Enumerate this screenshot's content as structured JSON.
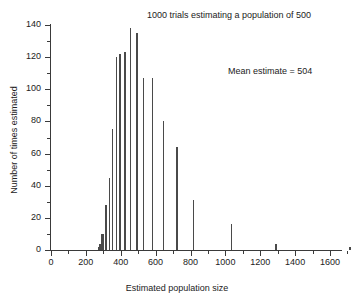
{
  "chart_data": {
    "type": "bar",
    "title": "1000 trials estimating a population of 500",
    "xlabel": "Estimated population size",
    "ylabel": "Number of times estimated",
    "annotation": "Mean estimate = 504",
    "xlim": [
      0,
      1750
    ],
    "ylim": [
      0,
      140
    ],
    "x_ticks": [
      0,
      200,
      400,
      600,
      800,
      1000,
      1200,
      1400,
      1600
    ],
    "x_minor_step": 100,
    "y_ticks": [
      0,
      20,
      40,
      60,
      80,
      100,
      120,
      140
    ],
    "y_minor_step": 10,
    "grid": false,
    "legend": false,
    "bar_color": "#4a4a4a",
    "x": [
      270,
      281,
      292,
      303,
      315,
      327,
      341,
      355,
      371,
      388,
      406,
      426,
      447,
      471,
      497,
      526,
      558,
      594,
      635,
      681,
      735,
      798,
      857,
      1030,
      1285,
      1710
    ],
    "values": [
      2,
      3,
      10,
      10,
      5,
      28,
      45,
      75,
      28,
      120,
      122,
      123,
      138,
      135,
      107,
      107,
      80,
      80,
      64,
      31,
      31,
      16,
      4,
      16,
      4,
      2
    ],
    "categories": [
      "270",
      "281",
      "292",
      "303",
      "315",
      "327",
      "341",
      "355",
      "371",
      "388",
      "406",
      "426",
      "447",
      "471",
      "497",
      "526",
      "558",
      "594",
      "635",
      "681",
      "735",
      "798",
      "857",
      "1030",
      "1285",
      "1710"
    ],
    "series": [
      {
        "name": "Estimate frequency",
        "points": [
          {
            "x": 268,
            "y": 2
          },
          {
            "x": 278,
            "y": 4
          },
          {
            "x": 288,
            "y": 10
          },
          {
            "x": 297,
            "y": 10
          },
          {
            "x": 312,
            "y": 28
          },
          {
            "x": 330,
            "y": 45
          },
          {
            "x": 348,
            "y": 75
          },
          {
            "x": 370,
            "y": 120
          },
          {
            "x": 392,
            "y": 122
          },
          {
            "x": 420,
            "y": 123
          },
          {
            "x": 452,
            "y": 138
          },
          {
            "x": 487,
            "y": 135
          },
          {
            "x": 527,
            "y": 107
          },
          {
            "x": 578,
            "y": 107
          },
          {
            "x": 640,
            "y": 80
          },
          {
            "x": 718,
            "y": 64
          },
          {
            "x": 812,
            "y": 31
          },
          {
            "x": 1030,
            "y": 16
          },
          {
            "x": 1285,
            "y": 4
          },
          {
            "x": 1710,
            "y": 2
          }
        ]
      }
    ]
  }
}
